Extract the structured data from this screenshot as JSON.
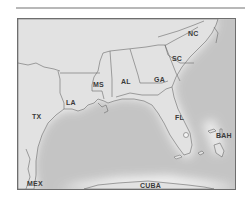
{
  "map": {
    "title": "",
    "colors": {
      "land": "#e2e2e2",
      "water": "#c4c4c4",
      "coast_glow": "#f4f4f4",
      "border": "#6e6e6e",
      "label": "#3a3a3a"
    },
    "labels": [
      {
        "id": "nc",
        "text": "NC",
        "x": 170,
        "y": 11
      },
      {
        "id": "sc",
        "text": "SC",
        "x": 154,
        "y": 36
      },
      {
        "id": "ga",
        "text": "GA",
        "x": 136,
        "y": 57
      },
      {
        "id": "al",
        "text": "AL",
        "x": 103,
        "y": 59
      },
      {
        "id": "ms",
        "text": "MS",
        "x": 75,
        "y": 62
      },
      {
        "id": "la",
        "text": "LA",
        "x": 48,
        "y": 80
      },
      {
        "id": "tx",
        "text": "TX",
        "x": 14,
        "y": 94
      },
      {
        "id": "fl",
        "text": "FL",
        "x": 157,
        "y": 95
      },
      {
        "id": "bah",
        "text": "BAH",
        "x": 198,
        "y": 113
      },
      {
        "id": "mex",
        "text": "MEX",
        "x": 9,
        "y": 161
      },
      {
        "id": "cuba",
        "text": "CUBA",
        "x": 122,
        "y": 163
      }
    ]
  }
}
